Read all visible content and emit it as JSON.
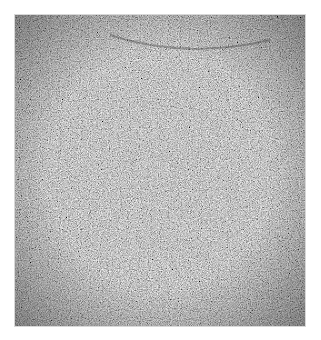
{
  "image": {
    "description": "Grayscale granular noise texture square with darker, coarser-grained edges and a faint arc near the top",
    "colors": {
      "background": "#ffffff",
      "texture_base": "#6e6e6e",
      "edge_dark": "#3a3a3a",
      "highlight": "#bdbdbd"
    }
  }
}
